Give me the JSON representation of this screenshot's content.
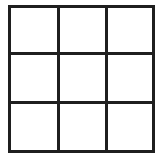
{
  "figure": {
    "name": "three-by-three-grid",
    "background_color": "#ffffff"
  },
  "grid": {
    "rows": 3,
    "columns": 3,
    "cell_count": 9,
    "line_color": "#1f1f1f",
    "line_width_px": 3,
    "cell_fill_color": "#ffffff",
    "bounds": {
      "x": 8,
      "y": 5,
      "width": 147,
      "height": 148
    },
    "vertical_line_x": [
      9.5,
      58,
      106,
      153.5
    ],
    "horizontal_line_y": [
      6.5,
      53,
      102,
      151.5
    ],
    "cells": [
      {
        "id": "cell-r1c1",
        "row": 1,
        "column": 1,
        "label": ""
      },
      {
        "id": "cell-r1c2",
        "row": 1,
        "column": 2,
        "label": ""
      },
      {
        "id": "cell-r1c3",
        "row": 1,
        "column": 3,
        "label": ""
      },
      {
        "id": "cell-r2c1",
        "row": 2,
        "column": 1,
        "label": ""
      },
      {
        "id": "cell-r2c2",
        "row": 2,
        "column": 2,
        "label": ""
      },
      {
        "id": "cell-r2c3",
        "row": 2,
        "column": 3,
        "label": ""
      },
      {
        "id": "cell-r3c1",
        "row": 3,
        "column": 1,
        "label": ""
      },
      {
        "id": "cell-r3c2",
        "row": 3,
        "column": 2,
        "label": ""
      },
      {
        "id": "cell-r3c3",
        "row": 3,
        "column": 3,
        "label": ""
      }
    ]
  }
}
